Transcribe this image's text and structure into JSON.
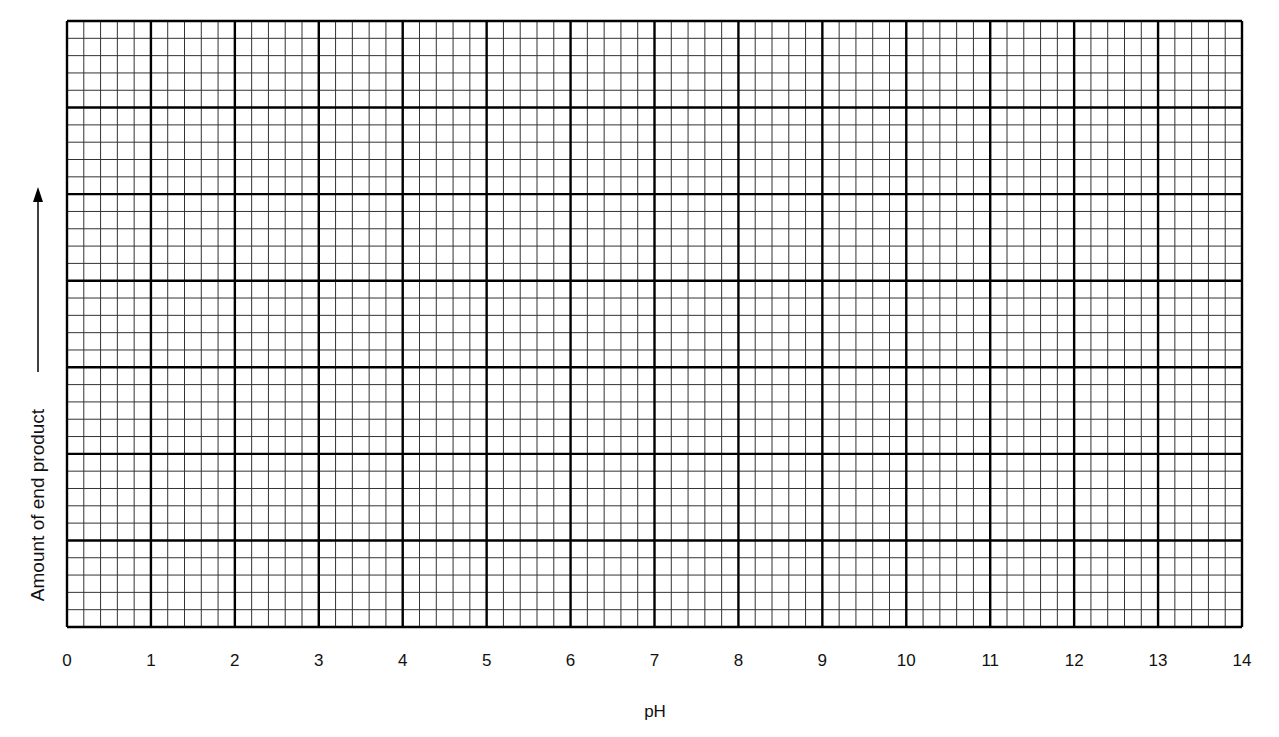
{
  "chart_data": {
    "type": "line",
    "title": "",
    "xlabel": "pH",
    "ylabel": "Amount of end product",
    "x_ticks": [
      "0",
      "1",
      "2",
      "3",
      "4",
      "5",
      "6",
      "7",
      "8",
      "9",
      "10",
      "11",
      "12",
      "13",
      "14"
    ],
    "xlim": [
      0,
      14
    ],
    "y_ticks": [],
    "grid": true,
    "grid_major_x": 14,
    "grid_major_y": 7,
    "grid_minor_per_major": 5,
    "series": [],
    "y_axis_arrow": "up",
    "legend": null,
    "colors": {
      "major_line": "#000000",
      "minor_line": "#333333",
      "background": "#ffffff"
    }
  }
}
